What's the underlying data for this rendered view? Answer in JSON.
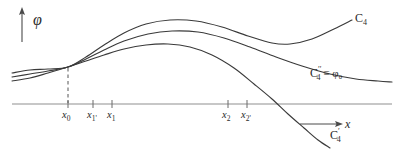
{
  "figure": {
    "background_color": "#ffffff",
    "stroke_color": "#3a3a3a",
    "axis_color": "#8a8a8a"
  },
  "axes": {
    "y_axis": {
      "label": "φ",
      "name": "phi",
      "arrow": "up",
      "x": 22,
      "y_top": 10,
      "y_bottom": 42
    },
    "x_axis": {
      "label": "x",
      "arrow_label": "⟶  x",
      "y": 104,
      "x_start": 12,
      "x_end": 392
    }
  },
  "ticks": [
    {
      "id": "x0",
      "label": "x",
      "sub": "0",
      "x": 68,
      "dashed_guide": true
    },
    {
      "id": "x1prime",
      "label": "x",
      "sub": "1'",
      "x": 93,
      "dashed_guide": false
    },
    {
      "id": "x1",
      "label": "x",
      "sub": "1",
      "x": 112,
      "dashed_guide": false
    },
    {
      "id": "x2",
      "label": "x",
      "sub": "2",
      "x": 228,
      "dashed_guide": false
    },
    {
      "id": "x2prime",
      "label": "x",
      "sub": "2'",
      "x": 247,
      "dashed_guide": false
    }
  ],
  "curve_labels": [
    {
      "id": "c4",
      "base": "C",
      "sub": "4",
      "sup": "",
      "extra": "",
      "x": 355,
      "y": 14
    },
    {
      "id": "c4double",
      "base": "C",
      "sub": "4",
      "sup": "′′",
      "extra": " ≡ φ₀",
      "x": 312,
      "y": 70
    },
    {
      "id": "c4prime",
      "base": "C",
      "sub": "4",
      "sup": "′",
      "extra": "",
      "x": 330,
      "y": 131
    }
  ],
  "chart_data": {
    "type": "line",
    "title": "",
    "xlabel": "x",
    "ylabel": "φ",
    "grid": false,
    "legend": "inline-curve-labels",
    "axis_y_pixel": 104,
    "common_point": {
      "x": 68,
      "y": 67,
      "tick": "x0"
    },
    "xlim": [
      12,
      392
    ],
    "ylim_pixel": [
      10,
      148
    ],
    "series": [
      {
        "name": "C₄",
        "label": "C4",
        "description": "upper branch: rises from left, peaks highest near x=175, dips to local minimum near x=282, then rises to right edge",
        "points": [
          [
            12,
            73
          ],
          [
            30,
            70
          ],
          [
            48,
            69
          ],
          [
            68,
            67
          ],
          [
            86,
            57
          ],
          [
            104,
            45
          ],
          [
            124,
            33
          ],
          [
            146,
            24
          ],
          [
            170,
            20
          ],
          [
            196,
            21
          ],
          [
            222,
            27
          ],
          [
            248,
            36
          ],
          [
            272,
            43
          ],
          [
            290,
            44
          ],
          [
            312,
            39
          ],
          [
            334,
            29
          ],
          [
            352,
            20
          ]
        ]
      },
      {
        "name": "C₄′′ ≡ φ₀",
        "label": "C4'' = phi0",
        "description": "middle branch: rises from left, peaks near x=180, then decays monotonically to a flat tail at right",
        "points": [
          [
            12,
            77
          ],
          [
            30,
            74
          ],
          [
            48,
            71
          ],
          [
            68,
            67
          ],
          [
            86,
            59
          ],
          [
            104,
            50
          ],
          [
            124,
            41
          ],
          [
            148,
            34
          ],
          [
            172,
            31
          ],
          [
            198,
            32
          ],
          [
            224,
            38
          ],
          [
            250,
            47
          ],
          [
            276,
            57
          ],
          [
            302,
            66
          ],
          [
            330,
            74
          ],
          [
            356,
            79
          ],
          [
            378,
            81
          ],
          [
            392,
            82
          ]
        ]
      },
      {
        "name": "C₄′",
        "label": "C4'",
        "description": "lower branch: rises from left, peaks near x=168, then falls steeply crossing the x-axis near x=278 and continues down off the bottom",
        "points": [
          [
            12,
            81
          ],
          [
            30,
            78
          ],
          [
            48,
            73
          ],
          [
            68,
            67
          ],
          [
            86,
            61
          ],
          [
            104,
            55
          ],
          [
            124,
            49
          ],
          [
            146,
            45
          ],
          [
            168,
            44
          ],
          [
            190,
            47
          ],
          [
            212,
            55
          ],
          [
            234,
            68
          ],
          [
            254,
            84
          ],
          [
            272,
            99
          ],
          [
            288,
            114
          ],
          [
            304,
            128
          ],
          [
            318,
            140
          ],
          [
            330,
            148
          ]
        ]
      }
    ]
  }
}
